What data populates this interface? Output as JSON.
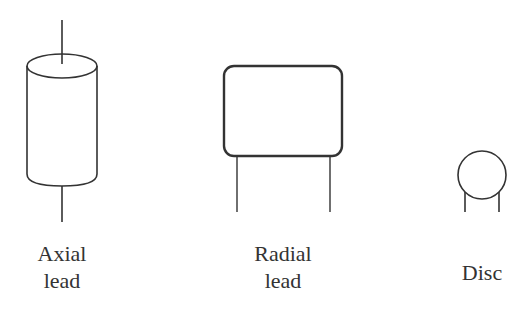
{
  "diagram": {
    "components": [
      {
        "id": "axial",
        "label_line1": "Axial",
        "label_line2": "lead"
      },
      {
        "id": "radial",
        "label_line1": "Radial",
        "label_line2": "lead"
      },
      {
        "id": "disc",
        "label_line1": "Disc",
        "label_line2": ""
      }
    ],
    "colors": {
      "stroke": "#333333",
      "background": "#ffffff"
    }
  }
}
